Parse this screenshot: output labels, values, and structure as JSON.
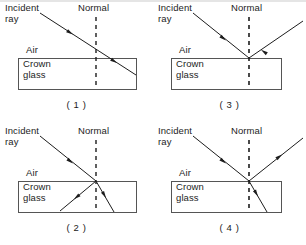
{
  "figure": {
    "panel_count": 4,
    "line_color": "#1d1d1d",
    "dash_color": "#1d1d1d",
    "box_color": "#555555",
    "background": "#ffffff"
  },
  "labels": {
    "incident_ray": "Incident\nray",
    "normal": "Normal",
    "air": "Air",
    "medium": "Crown\nglass"
  },
  "panels": [
    {
      "id": "panel-1",
      "caption": "( 1 )",
      "position": "top-left",
      "description": "Incident ray travels down-right through the air, strikes the boundary on the normal and continues straight on into the crown glass with no bending and no reflected ray.",
      "rays": [
        {
          "name": "incident-ray",
          "from": [
            40,
            13
          ],
          "to": [
            96,
            58
          ],
          "arrow_at": [
            71,
            43
          ],
          "arrow_dir": "down-right",
          "medium": "air"
        },
        {
          "name": "transmitted-ray",
          "from": [
            96,
            58
          ],
          "to": [
            136,
            75
          ],
          "arrow_at": [
            115,
            67
          ],
          "arrow_dir": "down-right",
          "medium": "crown glass"
        }
      ],
      "reflected_ray": false,
      "refracted_ray": true,
      "bending": "none"
    },
    {
      "id": "panel-3",
      "caption": "( 3 )",
      "position": "top-right",
      "description": "Incident ray travels down-right and is reflected back up-right into the air. No ray enters the crown glass.",
      "rays": [
        {
          "name": "incident-ray",
          "from": [
            193,
            13
          ],
          "to": [
            250,
            58
          ],
          "arrow_at": [
            224,
            43
          ],
          "arrow_dir": "down-right",
          "medium": "air"
        },
        {
          "name": "reflected-ray",
          "from": [
            303,
            21
          ],
          "to": [
            250,
            58
          ],
          "arrow_at": [
            267,
            47
          ],
          "arrow_dir": "down-left",
          "medium": "air"
        }
      ],
      "reflected_ray": true,
      "refracted_ray": false,
      "bending": "none"
    },
    {
      "id": "panel-2",
      "caption": "( 2 )",
      "position": "bottom-left",
      "description": "Incident ray travels down-right, continues into the crown glass, and a second ray leaves the same point travelling down-left inside the glass.",
      "rays": [
        {
          "name": "incident-ray",
          "from": [
            40,
            136
          ],
          "to": [
            96,
            185
          ],
          "arrow_at": [
            71,
            167
          ],
          "arrow_dir": "down-right",
          "medium": "air"
        },
        {
          "name": "transmitted-ray",
          "from": [
            96,
            185
          ],
          "to": [
            114,
            215
          ],
          "arrow_at": [
            106,
            201
          ],
          "arrow_dir": "down-right",
          "medium": "crown glass"
        },
        {
          "name": "second-internal-ray",
          "from": [
            96,
            185
          ],
          "to": [
            61,
            214
          ],
          "arrow_at": [
            76,
            202
          ],
          "arrow_dir": "down-left",
          "medium": "crown glass"
        }
      ],
      "reflected_ray": false,
      "refracted_ray": true,
      "bending": "toward-normal"
    },
    {
      "id": "panel-4",
      "caption": "( 4 )",
      "position": "bottom-right",
      "description": "Incident ray travels down-right, part is reflected back up-right into the air and part is refracted down-right into the crown glass, bending toward the normal.",
      "rays": [
        {
          "name": "incident-ray",
          "from": [
            193,
            136
          ],
          "to": [
            250,
            185
          ],
          "arrow_at": [
            224,
            163
          ],
          "arrow_dir": "down-right",
          "medium": "air"
        },
        {
          "name": "reflected-ray",
          "from": [
            250,
            185
          ],
          "to": [
            303,
            140
          ],
          "arrow_at": [
            280,
            160
          ],
          "arrow_dir": "up-right",
          "medium": "air"
        },
        {
          "name": "refracted-ray",
          "from": [
            250,
            185
          ],
          "to": [
            268,
            215
          ],
          "arrow_at": [
            259,
            199
          ],
          "arrow_dir": "down-right",
          "medium": "crown glass"
        }
      ],
      "reflected_ray": true,
      "refracted_ray": true,
      "bending": "toward-normal"
    }
  ],
  "geometry": {
    "box": {
      "width": 119,
      "height": 32,
      "left_offset": 18,
      "top_offset": 58
    },
    "normal_x_offset": 96,
    "normal_top": 17,
    "normal_bottom": 89,
    "normal_style": "dashed"
  }
}
